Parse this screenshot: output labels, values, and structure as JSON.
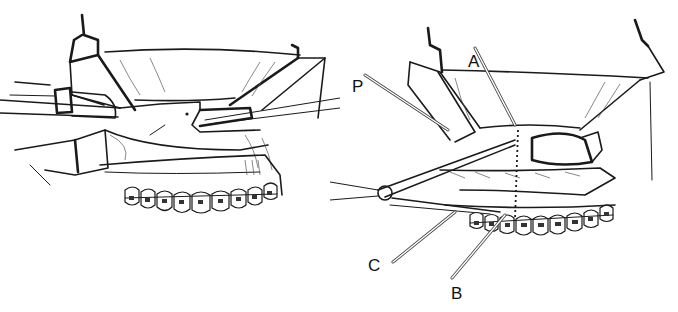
{
  "figure": {
    "left_panel": {
      "name": "osteotomy-with-saw",
      "elements": [
        "retractors",
        "oscillating-saw-handpiece",
        "osteotomy-cut",
        "maxillary-dentition-with-brackets"
      ]
    },
    "right_panel": {
      "name": "osteotomy-with-landmarks",
      "labels": {
        "P": "P",
        "A": "A",
        "C": "C",
        "B": "B"
      },
      "label_positions": {
        "P": {
          "x": 352,
          "y": 78
        },
        "A": {
          "x": 468,
          "y": 53
        },
        "C": {
          "x": 368,
          "y": 257
        },
        "B": {
          "x": 451,
          "y": 285
        }
      },
      "elements": [
        "retractors",
        "vertical-dotted-reference-line",
        "osteotome",
        "maxillary-dentition-with-brackets"
      ]
    },
    "colors": {
      "ink": "#1a1a1a",
      "background": "#ffffff"
    }
  }
}
